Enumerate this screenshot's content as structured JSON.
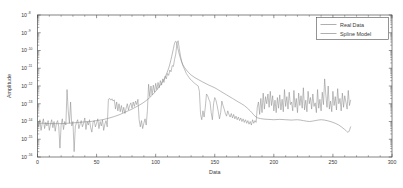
{
  "figure": {
    "background_color": "#ffffff",
    "axis_color": "#4d4d4d",
    "text_color": "#3a3a3a"
  },
  "chart_data": {
    "type": "line",
    "title": "",
    "xlabel": "Data",
    "ylabel": "Amplitude",
    "yscale": "log",
    "xlim": [
      0,
      300
    ],
    "ylim": [
      1e-16,
      1e-08
    ],
    "grid": false,
    "legend_position": "top-right",
    "xticks": [
      0,
      50,
      100,
      150,
      200,
      250,
      300
    ],
    "xtick_labels": [
      "0",
      "50",
      "100",
      "150",
      "200",
      "250",
      "300"
    ],
    "ytick_exponents": [
      -8,
      -9,
      -10,
      -11,
      -12,
      -13,
      -14,
      -15,
      -16
    ],
    "ytick_labels": [
      "10^-8",
      "10^-9",
      "10^-10",
      "10^-11",
      "10^-12",
      "10^-13",
      "10^-14",
      "10^-15",
      "10^-16"
    ],
    "ytick_mantissa": "10",
    "series": [
      {
        "name": "Real Data",
        "color": "#8c8c8c",
        "x": [
          0,
          1,
          2,
          3,
          4,
          5,
          6,
          7,
          8,
          9,
          10,
          11,
          12,
          13,
          14,
          15,
          16,
          17,
          18,
          19,
          20,
          21,
          22,
          23,
          24,
          25,
          26,
          27,
          28,
          29,
          30,
          31,
          32,
          33,
          34,
          35,
          36,
          37,
          38,
          39,
          40,
          41,
          42,
          43,
          44,
          45,
          46,
          47,
          48,
          49,
          50,
          51,
          52,
          53,
          54,
          55,
          56,
          57,
          58,
          59,
          60,
          61,
          62,
          63,
          64,
          65,
          66,
          67,
          68,
          69,
          70,
          71,
          72,
          73,
          74,
          75,
          76,
          77,
          78,
          79,
          80,
          81,
          82,
          83,
          84,
          85,
          86,
          87,
          88,
          89,
          90,
          91,
          92,
          93,
          94,
          95,
          96,
          97,
          98,
          99,
          100,
          101,
          102,
          103,
          104,
          105,
          106,
          107,
          108,
          109,
          110,
          111,
          112,
          113,
          114,
          115,
          116,
          117,
          118,
          119,
          120,
          121,
          122,
          123,
          124,
          125,
          126,
          127,
          128,
          129,
          130,
          131,
          132,
          133,
          134,
          135,
          136,
          137,
          138,
          139,
          140,
          141,
          142,
          143,
          144,
          145,
          146,
          147,
          148,
          149,
          150,
          151,
          152,
          153,
          154,
          155,
          156,
          157,
          158,
          159,
          160,
          161,
          162,
          163,
          164,
          165,
          166,
          167,
          168,
          169,
          170,
          171,
          172,
          173,
          174,
          175,
          176,
          177,
          178,
          179,
          180,
          181,
          182,
          183,
          184,
          185,
          186,
          187,
          188,
          189,
          190,
          191,
          192,
          193,
          194,
          195,
          196,
          197,
          198,
          199,
          200,
          201,
          202,
          203,
          204,
          205,
          206,
          207,
          208,
          209,
          210,
          211,
          212,
          213,
          214,
          215,
          216,
          217,
          218,
          219,
          220,
          221,
          222,
          223,
          224,
          225,
          226,
          227,
          228,
          229,
          230,
          231,
          232,
          233,
          234,
          235,
          236,
          237,
          238,
          239,
          240,
          241,
          242,
          243,
          244,
          245,
          246,
          247,
          248,
          249,
          250,
          251,
          252,
          253,
          254,
          255,
          256,
          257,
          258,
          259,
          260,
          261,
          262,
          263,
          264,
          265
        ],
        "log10_y": [
          -14.0,
          -14.3,
          -13.9,
          -14.5,
          -14.1,
          -13.85,
          -14.4,
          -14.05,
          -14.25,
          -13.95,
          -14.5,
          -14.15,
          -13.9,
          -14.35,
          -14.0,
          -14.55,
          -14.1,
          -13.95,
          -14.3,
          -15.5,
          -14.2,
          -13.85,
          -14.45,
          -14.0,
          -14.2,
          -12.2,
          -13.4,
          -14.1,
          -12.9,
          -14.25,
          -14.0,
          -15.7,
          -14.3,
          -14.05,
          -13.9,
          -14.4,
          -14.15,
          -13.95,
          -14.3,
          -14.1,
          -13.8,
          -14.45,
          -14.0,
          -14.2,
          -13.9,
          -14.35,
          -14.6,
          -14.05,
          -13.95,
          -14.3,
          -14.1,
          -13.85,
          -14.4,
          -14.0,
          -14.25,
          -13.9,
          -14.5,
          -14.15,
          -13.95,
          -14.3,
          -12.75,
          -12.7,
          -12.8,
          -12.72,
          -12.85,
          -12.78,
          -13.3,
          -12.9,
          -13.4,
          -13.0,
          -13.45,
          -13.1,
          -13.5,
          -13.2,
          -13.55,
          -13.25,
          -13.0,
          -13.35,
          -13.1,
          -12.95,
          -13.25,
          -12.9,
          -13.15,
          -12.85,
          -13.05,
          -12.75,
          -13.9,
          -14.3,
          -13.95,
          -14.4,
          -14.1,
          -13.85,
          -14.2,
          -13.4,
          -11.9,
          -12.6,
          -12.0,
          -12.5,
          -11.95,
          -12.35,
          -11.85,
          -12.2,
          -11.8,
          -12.1,
          -11.7,
          -11.95,
          -11.6,
          -11.8,
          -11.45,
          -11.6,
          -11.3,
          -11.4,
          -11.1,
          -11.2,
          -10.85,
          -10.9,
          -10.5,
          -10.2,
          -9.6,
          -9.45,
          -9.9,
          -10.3,
          -10.6,
          -10.85,
          -11.0,
          -11.15,
          -11.3,
          -11.4,
          -11.5,
          -11.6,
          -11.65,
          -11.72,
          -11.8,
          -11.85,
          -11.9,
          -11.95,
          -12.0,
          -12.3,
          -13.6,
          -13.9,
          -13.4,
          -13.75,
          -13.2,
          -12.45,
          -12.55,
          -12.75,
          -12.9,
          -13.5,
          -13.9,
          -13.0,
          -12.65,
          -12.8,
          -13.1,
          -13.45,
          -13.85,
          -13.5,
          -12.85,
          -13.1,
          -13.3,
          -13.55,
          -13.7,
          -13.4,
          -13.6,
          -13.75,
          -13.55,
          -13.8,
          -13.6,
          -13.85,
          -13.7,
          -13.9,
          -13.75,
          -13.95,
          -13.8,
          -14.0,
          -13.85,
          -14.05,
          -13.9,
          -14.1,
          -13.95,
          -14.15,
          -14.0,
          -14.2,
          -13.9,
          -14.1,
          -13.95,
          -14.05,
          -13.2,
          -12.9,
          -13.6,
          -12.7,
          -13.5,
          -12.4,
          -13.3,
          -12.6,
          -13.0,
          -12.45,
          -13.2,
          -12.3,
          -13.1,
          -12.55,
          -13.4,
          -12.8,
          -13.5,
          -12.65,
          -13.25,
          -12.5,
          -13.35,
          -12.75,
          -13.45,
          -12.2,
          -13.15,
          -12.6,
          -13.3,
          -12.35,
          -13.05,
          -12.9,
          -13.4,
          -12.25,
          -13.2,
          -12.7,
          -13.5,
          -12.4,
          -13.1,
          -12.55,
          -13.25,
          -12.1,
          -13.35,
          -12.8,
          -13.45,
          -12.3,
          -13.0,
          -12.65,
          -13.3,
          -12.45,
          -13.15,
          -12.95,
          -13.5,
          -12.2,
          -13.25,
          -12.75,
          -13.4,
          -12.35,
          -13.05,
          -11.6,
          -12.5,
          -13.2,
          -12.0,
          -13.3,
          -12.85,
          -13.45,
          -12.3,
          -13.1,
          -12.6,
          -13.35,
          -12.15,
          -13.0,
          -12.7,
          -13.4,
          -12.4,
          -13.2,
          -12.55,
          -12.9,
          -13.3,
          -12.25,
          -13.1,
          -12.8,
          -13.5,
          -12.45,
          -13.25,
          -12.9,
          -13.4,
          -13.6,
          -13.3
        ]
      },
      {
        "name": "Spline Model",
        "color": "#8c8c8c",
        "x": [
          0,
          5,
          10,
          15,
          20,
          25,
          30,
          35,
          40,
          45,
          50,
          55,
          60,
          65,
          70,
          75,
          80,
          85,
          90,
          95,
          100,
          105,
          108,
          111,
          113,
          115,
          116,
          117,
          118,
          119,
          121,
          123,
          126,
          130,
          135,
          140,
          145,
          150,
          155,
          160,
          165,
          170,
          175,
          180,
          185,
          190,
          195,
          200,
          205,
          210,
          215,
          220,
          225,
          230,
          235,
          240,
          245,
          250,
          255,
          260,
          263,
          265
        ],
        "log10_y": [
          -14.1,
          -14.1,
          -14.12,
          -14.12,
          -14.12,
          -14.1,
          -14.08,
          -14.05,
          -14.02,
          -14.0,
          -13.95,
          -13.9,
          -13.82,
          -13.72,
          -13.6,
          -13.45,
          -13.3,
          -13.12,
          -12.92,
          -12.65,
          -12.3,
          -11.85,
          -11.5,
          -11.0,
          -10.5,
          -9.9,
          -9.6,
          -9.48,
          -9.65,
          -9.95,
          -10.45,
          -10.8,
          -11.1,
          -11.38,
          -11.6,
          -11.78,
          -11.95,
          -12.1,
          -12.3,
          -12.5,
          -12.7,
          -12.9,
          -13.1,
          -13.4,
          -13.75,
          -13.85,
          -13.88,
          -13.9,
          -13.88,
          -13.9,
          -13.92,
          -13.9,
          -13.95,
          -14.0,
          -13.95,
          -13.9,
          -13.95,
          -14.05,
          -14.2,
          -14.45,
          -14.6,
          -14.3
        ]
      }
    ]
  },
  "legend": {
    "entries": [
      {
        "label": "Real Data"
      },
      {
        "label": "Spline Model"
      }
    ]
  }
}
